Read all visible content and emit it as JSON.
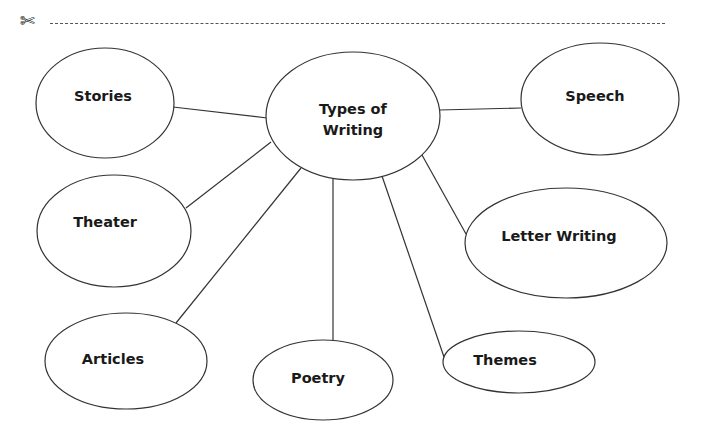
{
  "header": {
    "cut_icon": "scissors-icon",
    "cut_glyph": "✄"
  },
  "diagram": {
    "center": {
      "label_line1": "Types of",
      "label_line2": "Writing"
    },
    "nodes": [
      {
        "id": "stories",
        "label": "Stories"
      },
      {
        "id": "speech",
        "label": "Speech"
      },
      {
        "id": "theater",
        "label": "Theater"
      },
      {
        "id": "letter-writing",
        "label": "Letter Writing"
      },
      {
        "id": "articles",
        "label": "Articles"
      },
      {
        "id": "poetry",
        "label": "Poetry"
      },
      {
        "id": "themes",
        "label": "Themes"
      }
    ],
    "colors": {
      "stroke": "#333333",
      "text": "#1a1a1a",
      "background": "#ffffff"
    }
  }
}
